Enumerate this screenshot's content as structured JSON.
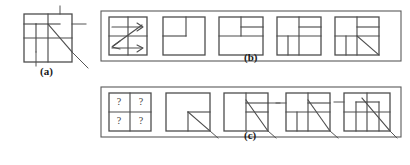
{
  "figure": {
    "background_color": "#ffffff",
    "line_color": "#4d4d4d",
    "text_color": "#1a1a1a",
    "width": 410,
    "height": 165
  },
  "captions": {
    "a": "(a)",
    "b": "(b)",
    "c": "(c)"
  },
  "panel_a": {
    "label": "(a)",
    "description": "source pattern square with internal subdivisions and a diagonal",
    "box": {
      "x": 4,
      "y": 6,
      "w": 56,
      "h": 52
    },
    "lines": [
      {
        "name": "outer-square"
      },
      {
        "name": "horizontal-mid"
      },
      {
        "name": "vertical-mid"
      },
      {
        "name": "inner-square-top-left"
      },
      {
        "name": "diagonal"
      },
      {
        "name": "overshoot-right"
      },
      {
        "name": "overshoot-bottom"
      },
      {
        "name": "overshoot-top"
      }
    ]
  },
  "panel_b": {
    "label": "(b)",
    "description": "decomposition sequence: scan order then successive quadtree splits",
    "cells": [
      {
        "index": 1,
        "name": "scan-order-cell",
        "content": "zigzag scan arrows over 2x2 grid"
      },
      {
        "index": 2,
        "name": "split-level-1-cell",
        "content": "single sub-square in upper-left quadrant"
      },
      {
        "index": 3,
        "name": "split-level-2-cell",
        "content": "upper-left quadrant plus split upper-right"
      },
      {
        "index": 4,
        "name": "split-level-3-cell",
        "content": "quadrants with lower-left subdivided"
      },
      {
        "index": 5,
        "name": "split-level-4-cell",
        "content": "full subdivision with diagonal in lower-right"
      }
    ]
  },
  "panel_c": {
    "label": "(c)",
    "description": "reconstruction sequence starting from unknown cells",
    "unknown_marker": "?",
    "unknown_markers": [
      "?",
      "?",
      "?",
      "?"
    ],
    "cells": [
      {
        "index": 1,
        "name": "unknown-cell",
        "content": "2x2 grid of question marks"
      },
      {
        "index": 2,
        "name": "recon-step-1-cell",
        "content": "square with diagonal in lower-right sub-square"
      },
      {
        "index": 3,
        "name": "recon-step-2-cell",
        "content": "vertical split with diagonal and right bands"
      },
      {
        "index": 4,
        "name": "recon-step-3-cell",
        "content": "quadrants with diagonal through right half"
      },
      {
        "index": 5,
        "name": "recon-step-4-cell",
        "content": "full subdivision with long diagonal"
      }
    ]
  }
}
